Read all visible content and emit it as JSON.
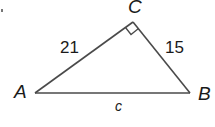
{
  "diagram": {
    "type": "right-triangle",
    "vertices": {
      "A": {
        "label": "A",
        "x": 35,
        "y": 93
      },
      "B": {
        "label": "B",
        "x": 190,
        "y": 93
      },
      "C": {
        "label": "C",
        "x": 133,
        "y": 22
      }
    },
    "right_angle_at": "C",
    "sides": {
      "AC": {
        "label": "21"
      },
      "CB": {
        "label": "15"
      },
      "AB": {
        "label": "c"
      }
    },
    "colors": {
      "stroke": "#4a4a4a",
      "text": "#1a1a1a",
      "background": "#ffffff"
    }
  }
}
